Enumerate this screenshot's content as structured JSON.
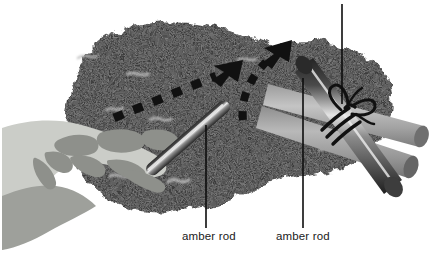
{
  "figure": {
    "width": 430,
    "height": 254,
    "background": "#ffffff"
  },
  "labels": {
    "left_rod": "amber rod",
    "right_rod": "amber rod"
  },
  "leader_lines": [
    {
      "name": "leader-line-left",
      "x": 206,
      "y_top": 125,
      "y_bottom": 228
    },
    {
      "name": "leader-line-right",
      "x": 303,
      "y_top": 78,
      "y_bottom": 228
    },
    {
      "name": "leader-line-top",
      "x": 342,
      "y_top": 4,
      "y_bottom": 104
    }
  ],
  "objects": {
    "fur": {
      "name": "fur-patch",
      "description": "dark speckled fur / cloth patch",
      "fill": "#3a3a3a",
      "speckle_light": "#b8b8b8"
    },
    "hand": {
      "name": "hand-xray",
      "description": "stylized translucent hand holding the rod",
      "skin": "#c9cbc6",
      "bone": "#8d8f8a",
      "shadow": "#9a9c97"
    },
    "rod_left": {
      "name": "amber-rod-left",
      "description": "glossy dark rod held in the hand, pointing up-right",
      "body_dark": "#2e2e2e",
      "body_mid": "#6e6e6e",
      "highlight": "#e8e8e8"
    },
    "rod_right": {
      "name": "amber-rod-right",
      "description": "glossy dark rod tied with string, pointing down-right",
      "body_dark": "#262626",
      "body_mid": "#6a6a6a",
      "highlight": "#e0e0e0"
    },
    "bundle_rods": {
      "name": "background-rod-bundle",
      "description": "two lighter grey rods behind the tied rod",
      "body_light": "#b6b6b6",
      "body_mid": "#8a8a8a",
      "cap": "#6f6f6f"
    },
    "string": {
      "name": "string-bow",
      "description": "black string wrapped around rod with a bow knot",
      "stroke": "#121212"
    }
  },
  "arrows": [
    {
      "name": "motion-arrow-straight",
      "style": "dashed",
      "direction": "up-right",
      "color": "#111111"
    },
    {
      "name": "motion-arrow-curved",
      "style": "dashed",
      "direction": "up-right-curved",
      "color": "#111111"
    }
  ]
}
